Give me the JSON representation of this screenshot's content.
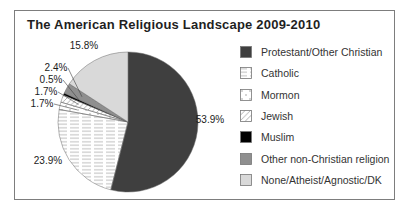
{
  "window": {
    "background": "#ffffff",
    "frame_border_color": "#7d7d7d"
  },
  "chart_data": {
    "type": "pie",
    "title": "The American Religious Landscape 2009-2010",
    "legend_position": "right",
    "direction": "clockwise-from-top",
    "pie": {
      "cx": 128,
      "cy": 122,
      "r": 70
    },
    "slices": [
      {
        "key": "protestant-other-christian",
        "label": "Protestant/Other Christian",
        "value": 53.9,
        "display": "53.9%",
        "fill": "#3f3f3f",
        "pattern": null,
        "label_pos": [
          210,
          119
        ],
        "leader": false
      },
      {
        "key": "catholic",
        "label": "Catholic",
        "value": 23.9,
        "display": "23.9%",
        "fill": "#ffffff",
        "pattern": "hlines",
        "label_pos": [
          48,
          160
        ],
        "leader": false
      },
      {
        "key": "mormon",
        "label": "Mormon",
        "value": 1.7,
        "display": "1.7%",
        "fill": "#ffffff",
        "pattern": "dots",
        "label_pos": [
          42,
          103
        ],
        "leader": true
      },
      {
        "key": "jewish",
        "label": "Jewish",
        "value": 1.7,
        "display": "1.7%",
        "fill": "#ffffff",
        "pattern": "diag",
        "label_pos": [
          46,
          91
        ],
        "leader": true
      },
      {
        "key": "muslim",
        "label": "Muslim",
        "value": 0.5,
        "display": "0.5%",
        "fill": "#000000",
        "pattern": null,
        "label_pos": [
          51,
          79
        ],
        "leader": true
      },
      {
        "key": "other-non-christian",
        "label": "Other non-Christian religion",
        "value": 2.4,
        "display": "2.4%",
        "fill": "#8f8f8f",
        "pattern": null,
        "label_pos": [
          56,
          67
        ],
        "leader": true
      },
      {
        "key": "none-atheist-agnostic-dk",
        "label": "None/Atheist/Agnostic/DK",
        "value": 15.8,
        "display": "15.8%",
        "fill": "#d9d9d9",
        "pattern": null,
        "label_pos": [
          84,
          45
        ],
        "leader": false
      }
    ],
    "pattern_stroke_color": "#9a9a9a",
    "slice_outline_color": "#6b6b6b",
    "leader_line_color": "#3f3f3f"
  }
}
